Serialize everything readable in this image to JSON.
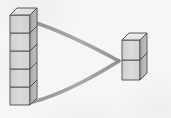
{
  "canvas": {
    "width": 171,
    "height": 118,
    "background_color": "#f6f6f4",
    "title": "Cube stack comparison diagram"
  },
  "palette": {
    "outline": "#4a4a4a",
    "front_face": "#d8d8d8",
    "side_face": "#b4b4b4",
    "top_face": "#ededed",
    "arc_stroke": "#9a9a9a",
    "shadow": "#c9c9c9",
    "background": "#f6f6f4"
  },
  "diagram": {
    "type": "isometric-cube-stacks",
    "stacks": [
      {
        "id": "tall-stack",
        "label": "left tall cube stack",
        "cube_count": 5,
        "position": {
          "x": 10,
          "y": 11
        },
        "cube_width": 20,
        "cube_height": 18,
        "depth_x": 7,
        "depth_y": 7
      },
      {
        "id": "short-stack",
        "label": "right short cube stack",
        "cube_count": 2,
        "position": {
          "x": 122,
          "y": 38
        },
        "cube_width": 18,
        "cube_height": 20,
        "depth_x": 7,
        "depth_y": 7
      }
    ],
    "connector": {
      "id": "funnel-arc",
      "label": "curved converging arc from tall stack to short stack",
      "shape": "two-curves-converging-right",
      "stroke_width": 3.4,
      "color": "#9a9a9a",
      "upper_curve": {
        "start": {
          "x": 33,
          "y": 22
        },
        "control1": {
          "x": 62,
          "y": 31
        },
        "control2": {
          "x": 95,
          "y": 48
        },
        "end": {
          "x": 119,
          "y": 61
        }
      },
      "lower_curve": {
        "start": {
          "x": 119,
          "y": 61
        },
        "control1": {
          "x": 95,
          "y": 76
        },
        "control2": {
          "x": 62,
          "y": 94
        },
        "end": {
          "x": 33,
          "y": 102
        }
      }
    }
  },
  "chart_data": {
    "type": "bar",
    "title": "Cube stack comparison",
    "xlabel": "",
    "ylabel": "Number of cubes",
    "categories": [
      "Left stack",
      "Right stack"
    ],
    "values": [
      5,
      2
    ],
    "ylim": [
      0,
      5
    ],
    "grid": false,
    "legend": "none",
    "annotations": [
      "curved arc connecting left stack to right stack"
    ]
  }
}
